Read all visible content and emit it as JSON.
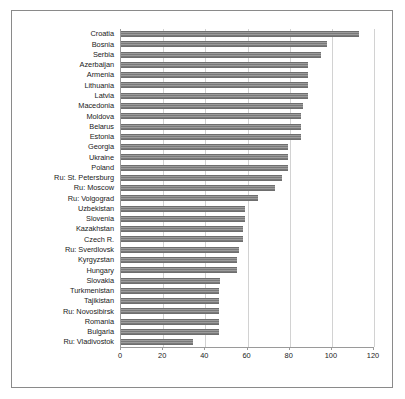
{
  "chart_data": {
    "type": "bar",
    "orientation": "horizontal",
    "title": "",
    "subtitle": "",
    "xlabel": "",
    "ylabel": "",
    "xlim": [
      0,
      120
    ],
    "xticks": [
      0,
      20,
      40,
      60,
      80,
      100,
      120
    ],
    "xtick_labels": [
      "0",
      "20",
      "40",
      "60",
      "80",
      "100",
      "120"
    ],
    "grid": "vertical",
    "legend": "none",
    "bar_color": "#808080",
    "gridline_color": "#d2d2d2",
    "axis_color": "#9a9a9a",
    "frame_color": "#8a8a8a",
    "categories": [
      "Croatia",
      "Bosnia",
      "Serbia",
      "Azerbaijan",
      "Armenia",
      "Lithuania",
      "Latvia",
      "Macedonia",
      "Moldova",
      "Belarus",
      "Estonia",
      "Georgia",
      "Ukraine",
      "Poland",
      "Ru: St. Petersburg",
      "Ru: Moscow",
      "Ru: Volgograd",
      "Uzbekistan",
      "Slovenia",
      "Kazakhstan",
      "Czech R.",
      "Ru: Sverdlovsk",
      "Kyrgyzstan",
      "Hungary",
      "Slovakia",
      "Turkmenistan",
      "Tajikistan",
      "Ru: Novosibirsk",
      "Romania",
      "Bulgaria",
      "Ru: Vladivostok"
    ],
    "values": [
      113,
      97.5,
      95,
      88.5,
      88.5,
      88.5,
      88.5,
      86.5,
      85.5,
      85.5,
      85.5,
      79,
      79,
      79,
      76.5,
      73,
      65,
      59,
      59,
      58,
      58,
      56,
      55,
      55,
      47,
      46.5,
      46.5,
      46.5,
      46.5,
      46.5,
      34
    ]
  }
}
